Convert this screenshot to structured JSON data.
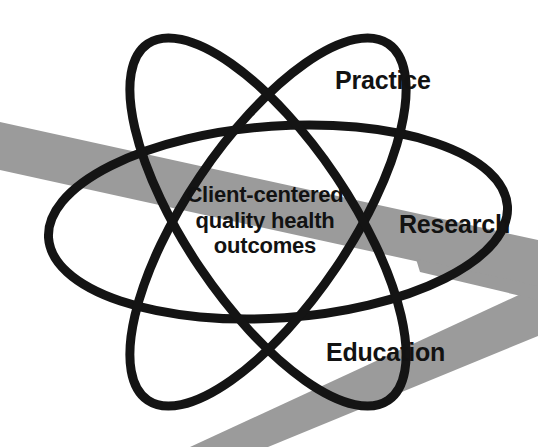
{
  "figure": {
    "type": "venn-atom-diagram",
    "background_color": "#ffffff",
    "orbit_color": "#141414",
    "band_color": "#9b9b9b",
    "text_color": "#121212",
    "center_label": {
      "lines": [
        "Client-centered",
        "quality health",
        "outcomes"
      ]
    },
    "orbit_labels": [
      {
        "id": "practice",
        "text": "Practice"
      },
      {
        "id": "research",
        "text": "Research"
      },
      {
        "id": "education",
        "text": "Education"
      }
    ]
  }
}
